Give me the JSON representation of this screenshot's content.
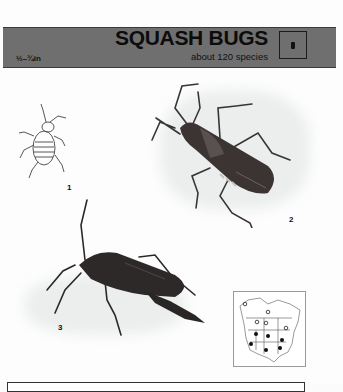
{
  "header": {
    "size_range": "½–¾in",
    "title": "SQUASH BUGS",
    "subtitle": "about 120 species",
    "icon": "bug-silhouette-icon"
  },
  "figures": [
    {
      "label": "1",
      "description": "squash bug nymph line drawing"
    },
    {
      "label": "2",
      "description": "adult squash bug, dorsal view"
    },
    {
      "label": "3",
      "description": "leaf-footed bug, side view"
    }
  ],
  "range_map": {
    "region": "North America",
    "legend_open_circle": "open circles",
    "legend_filled_circle": "filled circles"
  },
  "colors": {
    "header_band": "#6f6f6f",
    "text": "#111111",
    "page": "#fdfdfd"
  }
}
